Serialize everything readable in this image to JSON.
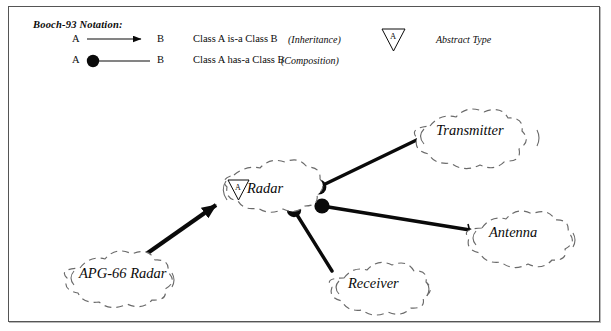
{
  "diagram": {
    "notation_title": "Booch-93 Notation:",
    "legend": {
      "rows": [
        {
          "source": "A",
          "target": "B",
          "description": "Class A  is-a Class B",
          "kind": "(Inheritance)",
          "connector": "arrow-line"
        },
        {
          "source": "A",
          "target": "B",
          "description": "Class A  has-a  Class B",
          "kind": "(Composition)",
          "connector": "filled-circle-line"
        }
      ],
      "abstract": {
        "glyph_letter": "A",
        "label": "Abstract Type",
        "symbol": "inverted-triangle"
      }
    },
    "nodes": [
      {
        "id": "radar",
        "label": "Radar",
        "abstract": true,
        "cx": 278,
        "cy": 192
      },
      {
        "id": "transmitter",
        "label": "Transmitter",
        "abstract": false,
        "cx": 476,
        "cy": 133
      },
      {
        "id": "antenna",
        "label": "Antenna",
        "abstract": false,
        "cx": 524,
        "cy": 235
      },
      {
        "id": "receiver",
        "label": "Receiver",
        "abstract": false,
        "cx": 385,
        "cy": 285
      },
      {
        "id": "apg66",
        "label": "APG-66 Radar",
        "abstract": false,
        "cx": 126,
        "cy": 275
      }
    ],
    "edges": [
      {
        "from": "radar",
        "to": "transmitter",
        "type": "composition"
      },
      {
        "from": "radar",
        "to": "antenna",
        "type": "composition"
      },
      {
        "from": "radar",
        "to": "receiver",
        "type": "composition"
      },
      {
        "from": "apg66",
        "to": "radar",
        "type": "inheritance"
      }
    ],
    "colors": {
      "ink": "#0a0a0a",
      "cloud_stroke": "#6a6a6a",
      "frame": "#555555",
      "background": "#ffffff"
    }
  }
}
